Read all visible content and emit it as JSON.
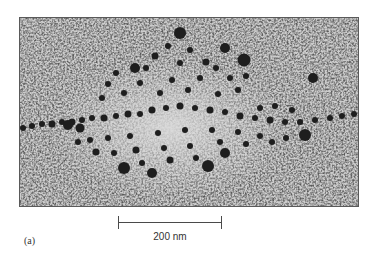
{
  "figure": {
    "panel_label": "(a)",
    "image_description": "electron micrograph of a chromatin / lampbrush-like fiber with radiating loops of dark granules on a speckled grey background",
    "scale_bar": {
      "label": "200 nm",
      "length_px": 104
    },
    "colors": {
      "background": "#c9c9c9",
      "particles": "#1e1e1e",
      "frame": "#5a5a5a",
      "text": "#333333"
    }
  }
}
